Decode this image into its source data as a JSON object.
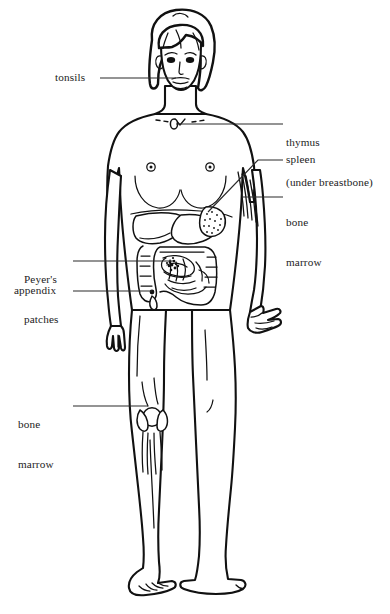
{
  "diagram": {
    "background_color": "#ffffff",
    "line_color": "#111111",
    "text_color": "#1c1c1c"
  },
  "labels": {
    "tonsils": {
      "text": "tonsils",
      "side": "left",
      "target_organ": "tonsils"
    },
    "thymus_line1": {
      "text": "thymus",
      "side": "right",
      "target_organ": "thymus"
    },
    "thymus_line2": {
      "text": "(under breastbone)",
      "side": "right"
    },
    "spleen": {
      "text": "spleen",
      "side": "right",
      "target_organ": "spleen"
    },
    "bone_marrow_arm_line1": {
      "text": "bone",
      "side": "right",
      "target_organ": "arm-bone-marrow"
    },
    "bone_marrow_arm_line2": {
      "text": "marrow",
      "side": "right"
    },
    "peyers_patches_line1": {
      "text": "Peyer's",
      "side": "left",
      "target_organ": "peyers-patches"
    },
    "peyers_patches_line2": {
      "text": "patches",
      "side": "left"
    },
    "appendix": {
      "text": "appendix",
      "side": "left",
      "target_organ": "appendix"
    },
    "bone_marrow_leg_line1": {
      "text": "bone",
      "side": "left",
      "target_organ": "knee-bone-marrow"
    },
    "bone_marrow_leg_line2": {
      "text": "marrow",
      "side": "left"
    }
  },
  "figure": {
    "visible_organs": [
      "tonsils",
      "thymus",
      "spleen",
      "liver",
      "stomach",
      "small-intestine",
      "large-intestine",
      "appendix",
      "peyers-patches",
      "rib-bone-marrow",
      "knee-bone-marrow"
    ]
  }
}
